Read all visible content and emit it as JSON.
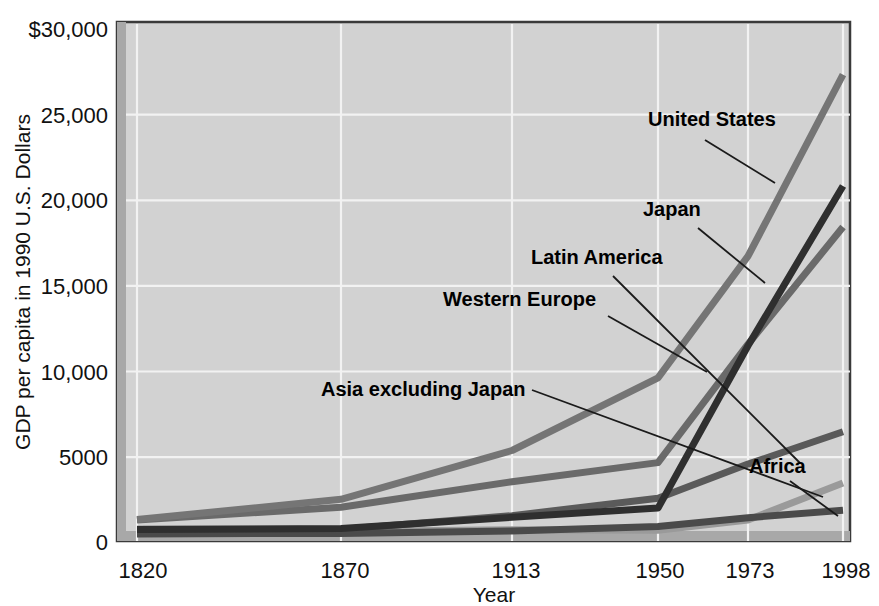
{
  "chart_data": {
    "type": "line",
    "title": "",
    "xlabel": "Year",
    "ylabel": "GDP per capita in 1990 U.S. Dollars",
    "x": [
      1820,
      1870,
      1913,
      1950,
      1973,
      1998
    ],
    "xtick_labels": [
      "1820",
      "1870",
      "1913",
      "1950",
      "1973",
      "1998"
    ],
    "ytick_labels": [
      "$30,000",
      "25,000",
      "20,000",
      "15,000",
      "10,000",
      "5000",
      "0"
    ],
    "yticks": [
      30000,
      25000,
      20000,
      15000,
      10000,
      5000,
      0
    ],
    "ylim": [
      0,
      30000
    ],
    "xlim": [
      1820,
      1998
    ],
    "grid": true,
    "legend_position": "inline-annotations",
    "plot_background": "#d2d2d2",
    "series": [
      {
        "name": "United States",
        "color": "#757575",
        "values": [
          1257,
          2445,
          5301,
          9561,
          16689,
          27331
        ],
        "label_x": 648,
        "label_y": 126,
        "leader": [
          [
            705,
            140
          ],
          [
            775,
            183
          ]
        ]
      },
      {
        "name": "Japan",
        "color": "#2f2f2f",
        "values": [
          669,
          737,
          1387,
          1926,
          11439,
          20800
        ],
        "label_x": 643,
        "label_y": 216,
        "leader": [
          [
            698,
            228
          ],
          [
            765,
            283
          ]
        ]
      },
      {
        "name": "Western Europe",
        "color": "#6a6a6a",
        "values": [
          1232,
          1974,
          3473,
          4594,
          11534,
          18400
        ],
        "label_x": 443,
        "label_y": 306,
        "leader": [
          [
            608,
            316
          ],
          [
            707,
            372
          ]
        ]
      },
      {
        "name": "Latin America",
        "color": "#5a5a5a",
        "values": [
          692,
          681,
          1481,
          2506,
          4504,
          6400
        ],
        "label_x": 531,
        "label_y": 264,
        "leader": [
          [
            613,
            276
          ],
          [
            800,
            463
          ]
        ]
      },
      {
        "name": "Asia excluding Japan",
        "color": "#9a9a9a",
        "values": [
          577,
          548,
          658,
          634,
          1231,
          3400
        ],
        "label_x": 321,
        "label_y": 396,
        "leader": [
          [
            532,
            390
          ],
          [
            823,
            497
          ]
        ]
      },
      {
        "name": "Africa",
        "color": "#4a4a4a",
        "values": [
          418,
          444,
          585,
          852,
          1365,
          1800
        ],
        "label_x": 749,
        "label_y": 473,
        "leader": [
          [
            790,
            481
          ],
          [
            838,
            516
          ]
        ]
      }
    ]
  },
  "axis": {
    "y_title": "GDP per capita in 1990 U.S. Dollars",
    "x_title": "Year"
  }
}
